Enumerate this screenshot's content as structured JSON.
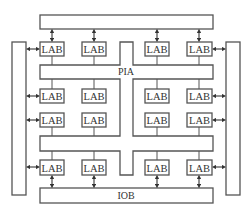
{
  "diagram": {
    "type": "CPLD architecture block diagram",
    "blocks": {
      "lab_label": "LAB",
      "pia_label": "PIA",
      "iob_label": "IOB"
    },
    "labs": [
      {
        "row": 1,
        "col": 1,
        "label": "LAB"
      },
      {
        "row": 1,
        "col": 2,
        "label": "LAB"
      },
      {
        "row": 1,
        "col": 3,
        "label": "LAB"
      },
      {
        "row": 1,
        "col": 4,
        "label": "LAB"
      },
      {
        "row": 2,
        "col": 1,
        "label": "LAB"
      },
      {
        "row": 2,
        "col": 2,
        "label": "LAB"
      },
      {
        "row": 2,
        "col": 3,
        "label": "LAB"
      },
      {
        "row": 2,
        "col": 4,
        "label": "LAB"
      },
      {
        "row": 3,
        "col": 1,
        "label": "LAB"
      },
      {
        "row": 3,
        "col": 2,
        "label": "LAB"
      },
      {
        "row": 3,
        "col": 3,
        "label": "LAB"
      },
      {
        "row": 3,
        "col": 4,
        "label": "LAB"
      },
      {
        "row": 4,
        "col": 1,
        "label": "LAB"
      },
      {
        "row": 4,
        "col": 2,
        "label": "LAB"
      },
      {
        "row": 4,
        "col": 3,
        "label": "LAB"
      },
      {
        "row": 4,
        "col": 4,
        "label": "LAB"
      }
    ],
    "iob_blocks": [
      "top",
      "left",
      "right",
      "bottom"
    ],
    "colors": {
      "stroke": "#555555",
      "text": "#333333",
      "background": "#ffffff"
    }
  }
}
